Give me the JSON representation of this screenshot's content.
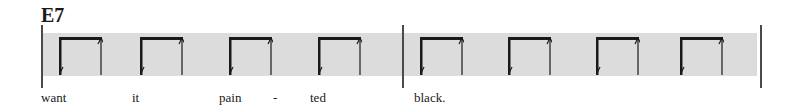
{
  "chord": "E7",
  "lyrics": [
    {
      "text": "want",
      "x": 41
    },
    {
      "text": "it",
      "x": 132
    },
    {
      "text": "pain",
      "x": 219
    },
    {
      "text": "-",
      "x": 273
    },
    {
      "text": "ted",
      "x": 310
    },
    {
      "text": "black.",
      "x": 414
    }
  ],
  "barlines": [
    41,
    402,
    760
  ],
  "strokes": [
    59,
    140,
    229,
    318,
    420,
    508,
    596,
    680
  ],
  "colors": {
    "band": "#dcdcdc",
    "ink": "#1a1a1a"
  }
}
